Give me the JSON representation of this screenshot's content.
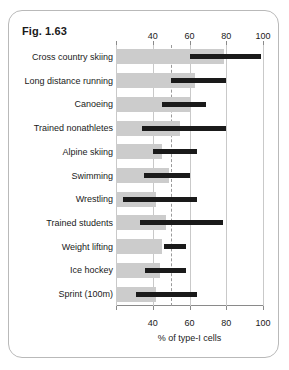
{
  "figure": {
    "title": "Fig. 1.63"
  },
  "chart_data": {
    "type": "bar",
    "title": "Fig. 1.63",
    "xlabel": "% of type-I cells",
    "ylabel": "",
    "xlim": [
      20,
      100
    ],
    "ticks": [
      20,
      40,
      60,
      80,
      100
    ],
    "tick_labels": [
      "",
      "40",
      "60",
      "80",
      "100"
    ],
    "reference_line": 50,
    "grid": true,
    "legend": "none",
    "orientation": "horizontal",
    "categories": [
      "Cross country skiing",
      "Long distance running",
      "Canoeing",
      "Trained nonathletes",
      "Alpine skiing",
      "Swimming",
      "Wrestling",
      "Trained students",
      "Weight lifting",
      "Ice hockey",
      "Sprint (100m)"
    ],
    "series": [
      {
        "name": "mean",
        "note": "grey bar extends from axis start to mean value",
        "values": [
          79,
          63,
          60,
          55,
          45,
          49,
          42,
          47,
          45,
          44,
          42
        ]
      },
      {
        "name": "range",
        "note": "black bar spans minimum to maximum observed value",
        "low": [
          60,
          50,
          45,
          34,
          40,
          35,
          24,
          33,
          46,
          36,
          31
        ],
        "high": [
          99,
          80,
          69,
          80,
          64,
          60,
          64,
          78,
          58,
          58,
          64
        ]
      }
    ]
  }
}
